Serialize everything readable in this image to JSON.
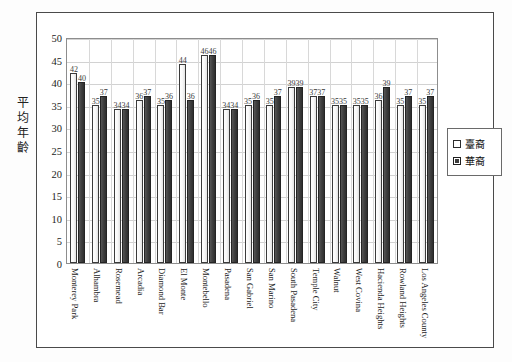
{
  "scan_artifact": {
    "top_sliver_text": "— ———— — — —— — — —— — — —"
  },
  "legend": {
    "position": "right",
    "entries": [
      {
        "label": "臺裔",
        "swatch": "light",
        "color": "#ffffff"
      },
      {
        "label": "華裔",
        "swatch": "dark",
        "color": "#3d3d3d"
      }
    ]
  },
  "axis": {
    "y_title_chars": [
      "平",
      "均",
      "年",
      "齡"
    ],
    "y_ticks": [
      50,
      45,
      40,
      35,
      30,
      25,
      20,
      15,
      10,
      5,
      0
    ]
  },
  "chart_data": {
    "type": "bar",
    "title": "",
    "xlabel": "",
    "ylabel": "平均年齡",
    "ylim": [
      0,
      50
    ],
    "ytick_step": 5,
    "grid": true,
    "legend_position": "right",
    "categories": [
      "Monterey Park",
      "Alhambra",
      "Rosemead",
      "Arcadia",
      "Diamond Bar",
      "El Monte",
      "Montebello",
      "Pasadena",
      "San Gabriel",
      "San Marino",
      "South Pasadena",
      "Temple City",
      "Walnut",
      "West Covina",
      "Hacienda Heights",
      "Rowland Heights",
      "Los Angeles County"
    ],
    "series": [
      {
        "name": "臺裔",
        "values": [
          42,
          35,
          34,
          36,
          35,
          44,
          46,
          34,
          35,
          35,
          39,
          37,
          35,
          35,
          36,
          35,
          35
        ]
      },
      {
        "name": "華裔",
        "values": [
          40,
          37,
          34,
          37,
          36,
          36,
          46,
          34,
          36,
          37,
          39,
          37,
          35,
          35,
          39,
          37,
          37
        ]
      }
    ]
  }
}
